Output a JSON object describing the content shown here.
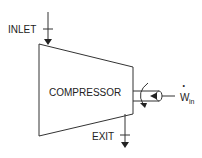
{
  "diagram": {
    "type": "thermodynamic-device",
    "device_label": "COMPRESSOR",
    "inlet_label": "INLET",
    "exit_label": "EXIT",
    "work": {
      "symbol": "W",
      "dot": "•",
      "subscript": "in"
    },
    "colors": {
      "stroke": "#222222",
      "background": "#ffffff"
    }
  }
}
